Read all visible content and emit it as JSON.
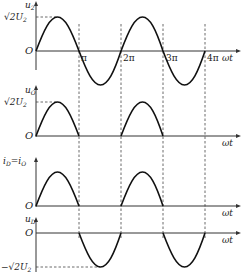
{
  "diagram": {
    "type": "half-wave rectifier waveforms",
    "x_axis_label": "ωt",
    "origin_label": "O",
    "x_ticks": [
      "π",
      "2π",
      "3π",
      "4π"
    ],
    "panels": [
      {
        "id": "u2",
        "y_label": "u₂",
        "peak_label": "√2U₂",
        "waveform": "full sine"
      },
      {
        "id": "uO",
        "y_label": "u_O",
        "peak_label": "√2U₂",
        "waveform": "positive half-waves only"
      },
      {
        "id": "iD",
        "y_label": "i_D=i_O",
        "waveform": "positive half-waves only"
      },
      {
        "id": "uD",
        "y_label": "u_D",
        "trough_label": "−√2U₂",
        "waveform": "negative half-waves only"
      }
    ]
  },
  "labels": {
    "u2": "u",
    "u2_sub": "2",
    "uO": "u",
    "uO_sub": "O",
    "iD": "i",
    "iD_sub": "D",
    "iD_eq": "=i",
    "iD_sub2": "O",
    "uD": "u",
    "uD_sub": "D",
    "peak_root": "√2U",
    "peak_sub": "2",
    "trough_root": "−√2U",
    "trough_sub": "2",
    "origin": "O",
    "wt": "ωt",
    "pi": "π",
    "two_pi": "2π",
    "three_pi": "3π",
    "four_pi": "4π"
  }
}
